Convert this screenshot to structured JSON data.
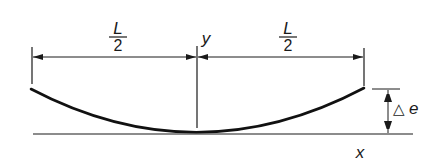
{
  "diagram": {
    "colors": {
      "ink": "#1a1a1a",
      "background": "#ffffff"
    },
    "labels": {
      "left_half_numerator": "L",
      "left_half_denominator": "2",
      "right_half_numerator": "L",
      "right_half_denominator": "2",
      "y_axis": "y",
      "x_axis": "x",
      "delta_e_symbol": "△",
      "delta_e_var": "e"
    }
  }
}
